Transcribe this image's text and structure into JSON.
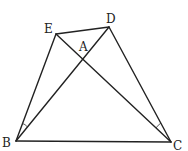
{
  "diagram": {
    "type": "geometry",
    "stroke_color": "#222222",
    "points": {
      "E": {
        "label": "E",
        "x": 56,
        "y": 34,
        "lx": 44,
        "ly": 33
      },
      "D": {
        "label": "D",
        "x": 109,
        "y": 27,
        "lx": 106,
        "ly": 23
      },
      "A": {
        "label": "A",
        "x": 83,
        "y": 54,
        "lx": 79,
        "ly": 51
      },
      "B": {
        "label": "B",
        "x": 16,
        "y": 141,
        "lx": 2,
        "ly": 147
      },
      "C": {
        "label": "C",
        "x": 171,
        "y": 142,
        "lx": 173,
        "ly": 150
      }
    },
    "segments": [
      "ED",
      "EB",
      "EC",
      "DB",
      "DC",
      "BC"
    ],
    "angle_marks": [
      {
        "vertex": "B",
        "between": [
          "E",
          "D"
        ],
        "description": "angle EBD marked"
      },
      {
        "vertex": "C",
        "between": [
          "E",
          "D"
        ],
        "description": "angle ECD marked"
      }
    ]
  }
}
